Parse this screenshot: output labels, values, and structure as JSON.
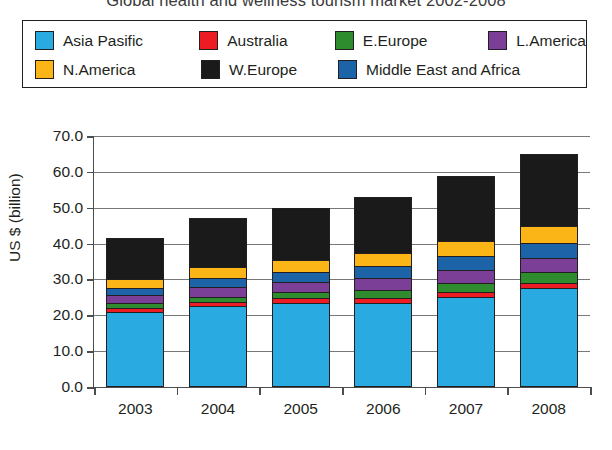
{
  "chart_data": {
    "type": "bar",
    "stacked": true,
    "title": "Global health and wellness tourism market 2002-2008",
    "xlabel": "",
    "ylabel": "US $ (billion)",
    "categories": [
      "2003",
      "2004",
      "2005",
      "2006",
      "2007",
      "2008"
    ],
    "ylim": [
      0.0,
      70.0
    ],
    "yticks": [
      "0.0",
      "10.0",
      "20.0",
      "30.0",
      "40.0",
      "50.0",
      "60.0",
      "70.0"
    ],
    "ytick_values": [
      0.0,
      10.0,
      20.0,
      30.0,
      40.0,
      50.0,
      60.0,
      70.0
    ],
    "grid": true,
    "legend_position": "top",
    "series": [
      {
        "name": "Asia Pasific",
        "color": "#29ABE2",
        "values": [
          20.5,
          22.0,
          23.0,
          23.0,
          24.5,
          27.0
        ]
      },
      {
        "name": "Australia",
        "color": "#ED1C24",
        "values": [
          0.7,
          0.8,
          0.9,
          1.0,
          1.2,
          1.3
        ]
      },
      {
        "name": "E.Europe",
        "color": "#2E8B2E",
        "values": [
          1.0,
          1.3,
          1.5,
          1.9,
          2.2,
          2.6
        ]
      },
      {
        "name": "L.America",
        "color": "#7B3F98",
        "values": [
          2.0,
          2.3,
          2.5,
          3.2,
          3.4,
          3.6
        ]
      },
      {
        "name": "Middle East and Africa",
        "color": "#1C63A8",
        "values": [
          1.8,
          2.3,
          2.5,
          3.0,
          3.5,
          4.0
        ]
      },
      {
        "name": "N.America",
        "color": "#FBB516",
        "values": [
          2.3,
          2.7,
          3.1,
          3.4,
          4.0,
          4.5
        ]
      },
      {
        "name": "W.Europe",
        "color": "#1A1A1A",
        "values": [
          13.2,
          15.6,
          16.5,
          17.5,
          20.0,
          22.0
        ]
      }
    ],
    "totals": [
      41.5,
      47.0,
      50.0,
      53.0,
      58.8,
      65.0
    ]
  },
  "legend": {
    "rows": [
      [
        {
          "label": "Asia Pasific",
          "color": "#29ABE2",
          "width_class": "lw-1"
        },
        {
          "label": "Australia",
          "color": "#ED1C24",
          "width_class": "lw-2"
        },
        {
          "label": "E.Europe",
          "color": "#2E8B2E",
          "width_class": "lw-3"
        },
        {
          "label": "L.America",
          "color": "#7B3F98",
          "width_class": "lw-4"
        }
      ],
      [
        {
          "label": "N.America",
          "color": "#FBB516",
          "width_class": "lw-5"
        },
        {
          "label": "W.Europe",
          "color": "#1A1A1A",
          "width_class": "lw-6"
        },
        {
          "label": "Middle East and Africa",
          "color": "#1C63A8",
          "width_class": "lw-7"
        }
      ]
    ]
  }
}
